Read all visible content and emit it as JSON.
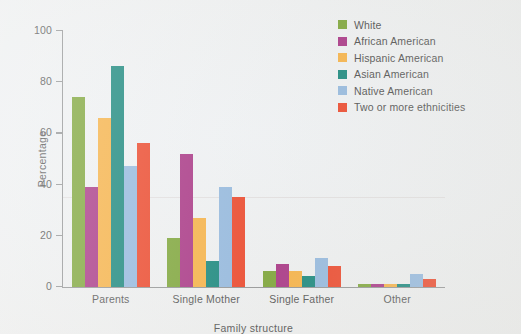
{
  "chart_data": {
    "type": "bar",
    "title": "",
    "xlabel": "Family structure",
    "ylabel": "Percentage",
    "categories": [
      "Parents",
      "Single Mother",
      "Single Father",
      "Other"
    ],
    "ylim": [
      0,
      100
    ],
    "yticks": [
      0,
      20,
      40,
      60,
      80,
      100
    ],
    "grid": false,
    "legend_position": "top-right",
    "series": [
      {
        "name": "White",
        "color": "#76a02e",
        "values": [
          74,
          19,
          6,
          1
        ]
      },
      {
        "name": "African American",
        "color": "#a32a7e",
        "values": [
          39,
          52,
          9,
          1
        ]
      },
      {
        "name": "Hispanic American",
        "color": "#f5ad3c",
        "values": [
          66,
          27,
          6,
          1
        ]
      },
      {
        "name": "Asian American",
        "color": "#0b8075",
        "values": [
          86,
          10,
          4,
          1
        ]
      },
      {
        "name": "Native American",
        "color": "#8db4dc",
        "values": [
          47,
          39,
          11,
          5
        ]
      },
      {
        "name": "Two or more ethnicities",
        "color": "#ea3c1e",
        "values": [
          56,
          35,
          8,
          3
        ]
      }
    ]
  }
}
